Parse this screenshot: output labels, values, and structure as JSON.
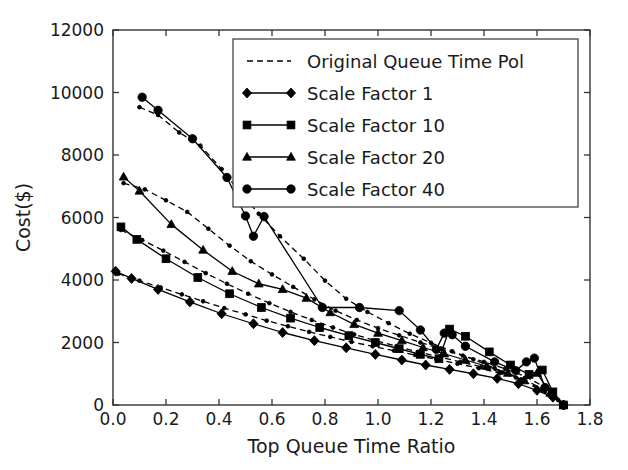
{
  "chart_data": {
    "type": "line",
    "title": "",
    "xlabel": "Top Queue Time Ratio",
    "ylabel": "Cost($)",
    "xlim": [
      0.0,
      1.8
    ],
    "ylim": [
      0,
      12000
    ],
    "xticks": [
      "0.0",
      "0.2",
      "0.4",
      "0.6",
      "0.8",
      "1.0",
      "1.2",
      "1.4",
      "1.6",
      "1.8"
    ],
    "xtick_values": [
      0.0,
      0.2,
      0.4,
      0.6,
      0.8,
      1.0,
      1.2,
      1.4,
      1.6,
      1.8
    ],
    "yticks": [
      "0",
      "2000",
      "4000",
      "6000",
      "8000",
      "10000",
      "12000"
    ],
    "ytick_values": [
      0,
      2000,
      4000,
      6000,
      8000,
      10000,
      12000
    ],
    "grid": false,
    "legend_position": "upper right",
    "series": [
      {
        "name": "Original Queue Time Pol",
        "marker": "dot-small",
        "linestyle": "dashed",
        "color": "#000000",
        "points": [
          [
            0.1,
            9530
          ],
          [
            0.17,
            9280
          ],
          [
            0.25,
            8720
          ],
          [
            0.33,
            8300
          ],
          [
            0.41,
            7550
          ],
          [
            0.48,
            6800
          ],
          [
            0.55,
            6120
          ],
          [
            0.63,
            5400
          ],
          [
            0.72,
            4680
          ],
          [
            0.8,
            3980
          ],
          [
            0.88,
            3400
          ],
          [
            0.96,
            2980
          ],
          [
            1.04,
            2620
          ],
          [
            1.12,
            2280
          ],
          [
            1.2,
            1990
          ],
          [
            1.28,
            1720
          ],
          [
            1.36,
            1460
          ],
          [
            1.44,
            1180
          ],
          [
            1.52,
            880
          ],
          [
            1.6,
            540
          ],
          [
            1.68,
            160
          ],
          [
            1.7,
            0
          ]
        ]
      },
      {
        "name": "Original Queue Time Pol (b)",
        "marker": "dot-small",
        "linestyle": "dashed",
        "color": "#000000",
        "points": [
          [
            0.04,
            7100
          ],
          [
            0.12,
            6900
          ],
          [
            0.2,
            6550
          ],
          [
            0.28,
            6180
          ],
          [
            0.36,
            5640
          ],
          [
            0.44,
            5100
          ],
          [
            0.52,
            4600
          ],
          [
            0.6,
            4180
          ],
          [
            0.68,
            3780
          ],
          [
            0.76,
            3380
          ],
          [
            0.84,
            3020
          ],
          [
            0.92,
            2720
          ],
          [
            1.0,
            2460
          ],
          [
            1.08,
            2230
          ],
          [
            1.16,
            2000
          ],
          [
            1.24,
            1790
          ],
          [
            1.32,
            1580
          ],
          [
            1.4,
            1380
          ],
          [
            1.48,
            1160
          ],
          [
            1.56,
            900
          ],
          [
            1.64,
            520
          ],
          [
            1.7,
            0
          ]
        ]
      },
      {
        "name": "Original Queue Time Pol (c)",
        "marker": "dot-small",
        "linestyle": "dashed",
        "color": "#000000",
        "points": [
          [
            0.03,
            5600
          ],
          [
            0.11,
            5280
          ],
          [
            0.19,
            4940
          ],
          [
            0.27,
            4580
          ],
          [
            0.35,
            4220
          ],
          [
            0.43,
            3880
          ],
          [
            0.51,
            3560
          ],
          [
            0.59,
            3260
          ],
          [
            0.67,
            2980
          ],
          [
            0.75,
            2720
          ],
          [
            0.83,
            2480
          ],
          [
            0.91,
            2260
          ],
          [
            0.99,
            2060
          ],
          [
            1.07,
            1880
          ],
          [
            1.15,
            1700
          ],
          [
            1.23,
            1540
          ],
          [
            1.31,
            1380
          ],
          [
            1.39,
            1220
          ],
          [
            1.47,
            1040
          ],
          [
            1.55,
            820
          ],
          [
            1.63,
            480
          ],
          [
            1.7,
            0
          ]
        ]
      },
      {
        "name": "Original Queue Time Pol (d)",
        "marker": "dot-small",
        "linestyle": "dashed",
        "color": "#000000",
        "points": [
          [
            0.02,
            4200
          ],
          [
            0.1,
            3980
          ],
          [
            0.18,
            3760
          ],
          [
            0.26,
            3540
          ],
          [
            0.34,
            3320
          ],
          [
            0.42,
            3100
          ],
          [
            0.5,
            2900
          ],
          [
            0.58,
            2700
          ],
          [
            0.66,
            2520
          ],
          [
            0.74,
            2340
          ],
          [
            0.82,
            2180
          ],
          [
            0.9,
            2020
          ],
          [
            0.98,
            1880
          ],
          [
            1.06,
            1740
          ],
          [
            1.14,
            1600
          ],
          [
            1.22,
            1460
          ],
          [
            1.3,
            1320
          ],
          [
            1.38,
            1180
          ],
          [
            1.46,
            1020
          ],
          [
            1.54,
            820
          ],
          [
            1.62,
            480
          ],
          [
            1.7,
            0
          ]
        ]
      },
      {
        "name": "Scale Factor 1",
        "marker": "diamond",
        "linestyle": "solid",
        "color": "#000000",
        "points": [
          [
            0.01,
            4280
          ],
          [
            0.07,
            4050
          ],
          [
            0.17,
            3700
          ],
          [
            0.29,
            3300
          ],
          [
            0.41,
            2920
          ],
          [
            0.53,
            2600
          ],
          [
            0.64,
            2320
          ],
          [
            0.76,
            2060
          ],
          [
            0.88,
            1830
          ],
          [
            0.99,
            1620
          ],
          [
            1.09,
            1440
          ],
          [
            1.18,
            1280
          ],
          [
            1.27,
            1140
          ],
          [
            1.36,
            1000
          ],
          [
            1.45,
            850
          ],
          [
            1.53,
            680
          ],
          [
            1.6,
            470
          ],
          [
            1.66,
            250
          ],
          [
            1.7,
            0
          ]
        ]
      },
      {
        "name": "Scale Factor 10",
        "marker": "square",
        "linestyle": "solid",
        "color": "#000000",
        "points": [
          [
            0.03,
            5700
          ],
          [
            0.09,
            5300
          ],
          [
            0.2,
            4680
          ],
          [
            0.32,
            4080
          ],
          [
            0.44,
            3560
          ],
          [
            0.56,
            3120
          ],
          [
            0.67,
            2780
          ],
          [
            0.78,
            2480
          ],
          [
            0.89,
            2220
          ],
          [
            0.99,
            2000
          ],
          [
            1.08,
            1800
          ],
          [
            1.16,
            1620
          ],
          [
            1.23,
            1480
          ],
          [
            1.27,
            2430
          ],
          [
            1.33,
            2200
          ],
          [
            1.42,
            1700
          ],
          [
            1.5,
            1280
          ],
          [
            1.57,
            980
          ],
          [
            1.62,
            1120
          ],
          [
            1.66,
            420
          ],
          [
            1.7,
            0
          ]
        ]
      },
      {
        "name": "Scale Factor 20",
        "marker": "triangle",
        "linestyle": "solid",
        "color": "#000000",
        "points": [
          [
            0.04,
            7300
          ],
          [
            0.1,
            6850
          ],
          [
            0.22,
            5780
          ],
          [
            0.34,
            4960
          ],
          [
            0.45,
            4280
          ],
          [
            0.55,
            3880
          ],
          [
            0.64,
            3700
          ],
          [
            0.73,
            3420
          ],
          [
            0.82,
            2960
          ],
          [
            0.91,
            2580
          ],
          [
            1.0,
            2300
          ],
          [
            1.09,
            2060
          ],
          [
            1.17,
            1840
          ],
          [
            1.25,
            1640
          ],
          [
            1.33,
            1440
          ],
          [
            1.41,
            1240
          ],
          [
            1.49,
            1020
          ],
          [
            1.55,
            780
          ],
          [
            1.6,
            1020
          ],
          [
            1.65,
            380
          ],
          [
            1.7,
            0
          ]
        ]
      },
      {
        "name": "Scale Factor 40",
        "marker": "circle",
        "linestyle": "solid",
        "color": "#000000",
        "points": [
          [
            0.11,
            9850
          ],
          [
            0.17,
            9430
          ],
          [
            0.3,
            8520
          ],
          [
            0.43,
            7280
          ],
          [
            0.5,
            6050
          ],
          [
            0.53,
            5400
          ],
          [
            0.57,
            6030
          ],
          [
            0.79,
            3120
          ],
          [
            0.93,
            3120
          ],
          [
            1.08,
            3020
          ],
          [
            1.16,
            2400
          ],
          [
            1.22,
            1780
          ],
          [
            1.25,
            2300
          ],
          [
            1.28,
            2250
          ],
          [
            1.33,
            1880
          ],
          [
            1.44,
            1380
          ],
          [
            1.52,
            1100
          ],
          [
            1.56,
            1380
          ],
          [
            1.59,
            1500
          ],
          [
            1.63,
            560
          ],
          [
            1.7,
            0
          ]
        ]
      }
    ],
    "legend_entries": [
      {
        "label": "Original Queue Time Pol",
        "marker": "dot-small",
        "linestyle": "dashed"
      },
      {
        "label": "Scale Factor 1",
        "marker": "diamond",
        "linestyle": "solid"
      },
      {
        "label": "Scale Factor 10",
        "marker": "square",
        "linestyle": "solid"
      },
      {
        "label": "Scale Factor 20",
        "marker": "triangle",
        "linestyle": "solid"
      },
      {
        "label": "Scale Factor 40",
        "marker": "circle",
        "linestyle": "solid"
      }
    ]
  }
}
